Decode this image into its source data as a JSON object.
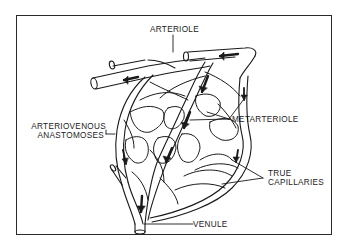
{
  "figure": {
    "type": "anatomical-diagram",
    "labels": {
      "arteriole": "ARTERIOLE",
      "metarteriole": "METARTERIOLE",
      "av_line1": "ARTERIOVENOUS",
      "av_line2": "ANASTOMOSES",
      "true_line1": "TRUE",
      "true_line2": "CAPILLARIES",
      "venule": "VENULE"
    },
    "colors": {
      "ink": "#1a1a1a",
      "background": "#ffffff",
      "frame": "#2a2a2a"
    }
  }
}
